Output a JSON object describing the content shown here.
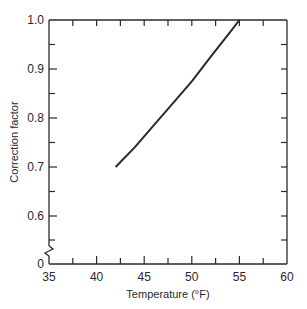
{
  "chart_data": {
    "type": "line",
    "title": "",
    "xlabel": "Temperature (°F)",
    "ylabel": "Correction factor",
    "xlim": [
      35,
      60
    ],
    "ylim": [
      0,
      1.0
    ],
    "y_axis_break": true,
    "y_axis_break_between": [
      0,
      0.55
    ],
    "x_ticks": [
      35,
      40,
      45,
      50,
      55,
      60
    ],
    "x_tick_labels": [
      "35",
      "40",
      "45",
      "50",
      "55",
      "60"
    ],
    "x_minor_ticks": [
      37.5,
      42.5,
      47.5,
      52.5,
      57.5
    ],
    "y_ticks": [
      0,
      0.6,
      0.7,
      0.8,
      0.9,
      1.0
    ],
    "y_tick_labels": [
      "0",
      "0.6",
      "0.7",
      "0.8",
      "0.9",
      "1.0"
    ],
    "y_minor_ticks": [
      0.55,
      0.65,
      0.75,
      0.85,
      0.95
    ],
    "grid": false,
    "legend": null,
    "series": [
      {
        "name": "Correction factor",
        "x": [
          42,
          44,
          46,
          48,
          50,
          52,
          54,
          55
        ],
        "y": [
          0.7,
          0.74,
          0.785,
          0.83,
          0.875,
          0.925,
          0.975,
          1.0
        ]
      }
    ]
  },
  "labels": {
    "xlabel": "Temperature (°F)",
    "ylabel": "Correction factor",
    "x_ticks": [
      "35",
      "40",
      "45",
      "50",
      "55",
      "60"
    ],
    "y_ticks": [
      "1.0",
      "0.9",
      "0.8",
      "0.7",
      "0.6",
      "0"
    ]
  }
}
